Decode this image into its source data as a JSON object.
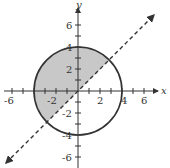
{
  "diagram": {
    "title": "",
    "axes": {
      "x_label": "x",
      "y_label": "y",
      "x_ticks": [
        "-6",
        "-2",
        "2",
        "4",
        "6"
      ],
      "y_ticks": [
        "6",
        "4",
        "2",
        "-2",
        "-4",
        "-6"
      ],
      "range": [
        -7,
        7
      ]
    },
    "circle": {
      "center": [
        0,
        0
      ],
      "radius": 4,
      "style": "solid"
    },
    "line": {
      "equation": "y = x",
      "style": "dashed",
      "arrows": "both"
    },
    "shaded_region": "inside circle, above line y = x",
    "colors": {
      "shade": "#c8c8c8",
      "stroke": "#333333"
    }
  }
}
